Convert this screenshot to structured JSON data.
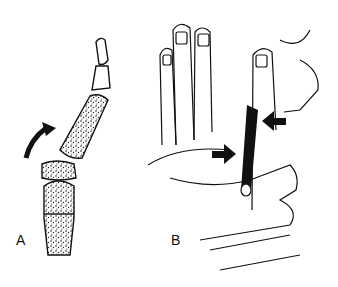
{
  "figure": {
    "panels": [
      {
        "label": "A",
        "description": "Finger bones with fractured phalanx base; curved arrow indicating dorsal displacement"
      },
      {
        "label": "B",
        "description": "Examiner's hands stabilizing a finger; two black arrows indicating pressure at the joint"
      }
    ],
    "colors": {
      "ink": "#111111",
      "background": "#ffffff"
    }
  }
}
